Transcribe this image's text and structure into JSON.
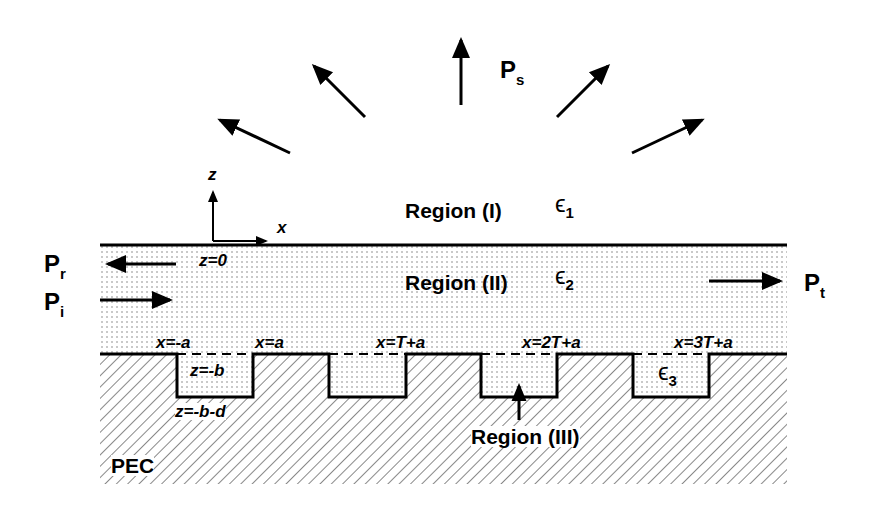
{
  "figure": {
    "power_labels": {
      "scattered": {
        "main": "P",
        "sub": "s"
      },
      "reflected": {
        "main": "P",
        "sub": "r"
      },
      "incident": {
        "main": "P",
        "sub": "i"
      },
      "transmitted": {
        "main": "P",
        "sub": "t"
      }
    },
    "axes": {
      "z": "z",
      "x": "x",
      "origin": "z=0"
    },
    "regions": {
      "r1": {
        "label": "Region (I)",
        "eps": "ϵ",
        "eps_sub": "1"
      },
      "r2": {
        "label": "Region (II)",
        "eps": "ϵ",
        "eps_sub": "2"
      },
      "r3": {
        "label": "Region (III)",
        "eps": "ϵ",
        "eps_sub": "3"
      }
    },
    "boundaries": {
      "x_neg_a": "x=-a",
      "x_a": "x=a",
      "x_T_a": "x=T+a",
      "x_2T_a": "x=2T+a",
      "x_3T_a": "x=3T+a",
      "z_neg_b": "z=-b",
      "z_neg_b_d": "z=-b-d"
    },
    "substrate": "PEC",
    "grooves": [
      {
        "x1": 177,
        "x2": 253
      },
      {
        "x1": 329,
        "x2": 406
      },
      {
        "x1": 481,
        "x2": 557
      },
      {
        "x1": 633,
        "x2": 709
      }
    ],
    "colors": {
      "line": "#000000",
      "background": "#ffffff"
    }
  }
}
